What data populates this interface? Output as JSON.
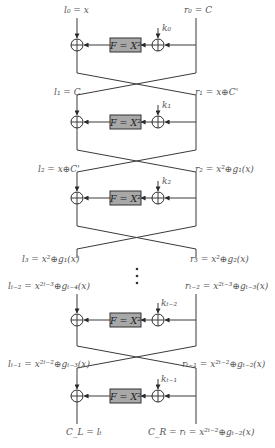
{
  "diagram": {
    "title": "",
    "colors": {
      "line": "#3a3a3a",
      "box_fill": "#a8a8a8",
      "text": "#555555"
    },
    "round_function_label": "F = X²",
    "labels": {
      "l0": "l₀ = x",
      "r0": "r₀ = C",
      "l1": "l₁ = C",
      "r1": "r₁ = x⊕C'",
      "l2": "l₂ = x⊕C'",
      "r2": "r₂ = x²⊕g₁(x)",
      "l3": "l₃ = x²⊕g₁(x)",
      "r3": "r₃ = x²⊕g₂(x)",
      "lt2": "lₜ₋₂ = x²ᵗ⁻³⊕gₜ₋₄(x)",
      "rt2": "rₜ₋₂ = x²ᵗ⁻³⊕gₜ₋₃(x)",
      "lt1": "lₜ₋₁ = x²ᵗ⁻²⊕gₜ₋₃(x)",
      "rt1": "rₜ₋₁ = x²ᵗ⁻²⊕gₜ₋₂(x)",
      "CL": "C_L = lₜ",
      "CR": "C_R = rₜ = x²ᵗ⁻²⊕gₜ₋₂(x)"
    },
    "keys": [
      "k₀",
      "k₁",
      "k₂",
      "kₜ₋₂",
      "kₜ₋₁"
    ],
    "ellipsis": "⋮"
  }
}
